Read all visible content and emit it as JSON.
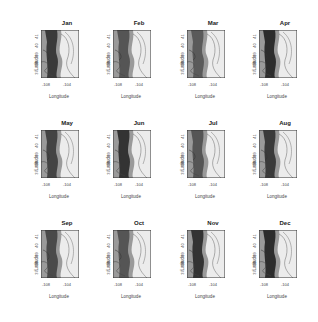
{
  "chart_data": {
    "type": "heatmap",
    "layout": "3x4 small multiples of filled contour maps",
    "panels": [
      "Jan",
      "Feb",
      "Mar",
      "Apr",
      "May",
      "Jun",
      "Jul",
      "Aug",
      "Sep",
      "Oct",
      "Nov",
      "Dec"
    ],
    "xlabel": "Longitude",
    "ylabel": "Latitude",
    "xticks": [
      "-108",
      "-104"
    ],
    "yticks": [
      "37",
      "38",
      "39",
      "40",
      "41"
    ],
    "colorscale": "grayscale (dark = high, light = low)",
    "grid": false,
    "legend": "none"
  },
  "labels": {
    "xlabel": "Longitude",
    "ylabel": "Latitude",
    "xt1": "-108",
    "xt2": "-104",
    "y37": "37",
    "y38": "38",
    "y39": "39",
    "y40": "40",
    "y41": "41"
  },
  "panels": [
    {
      "name": "Jan",
      "shade": "#3a3a3a"
    },
    {
      "name": "Feb",
      "shade": "#555"
    },
    {
      "name": "Mar",
      "shade": "#5a5a5a"
    },
    {
      "name": "Apr",
      "shade": "#2c2c2c"
    },
    {
      "name": "May",
      "shade": "#444"
    },
    {
      "name": "Jun",
      "shade": "#333"
    },
    {
      "name": "Jul",
      "shade": "#555"
    },
    {
      "name": "Aug",
      "shade": "#3a3a3a"
    },
    {
      "name": "Sep",
      "shade": "#4a4a4a"
    },
    {
      "name": "Oct",
      "shade": "#555"
    },
    {
      "name": "Nov",
      "shade": "#333"
    },
    {
      "name": "Dec",
      "shade": "#2c2c2c"
    }
  ]
}
